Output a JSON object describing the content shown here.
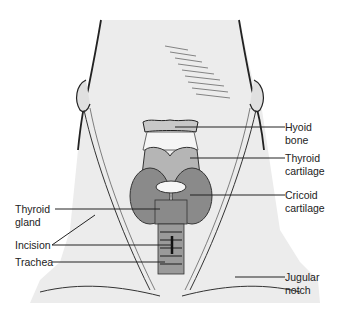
{
  "figure": {
    "labels": {
      "hyoid_bone": [
        "Hyoid",
        "bone"
      ],
      "thyroid_cartilage": [
        "Thyroid",
        "cartilage"
      ],
      "cricoid_cartilage": [
        "Cricoid",
        "cartilage"
      ],
      "thyroid_gland": [
        "Thyroid",
        "gland"
      ],
      "incision": [
        "Incision"
      ],
      "trachea": [
        "Trachea"
      ],
      "jugular_notch": [
        "Jugular",
        "notch"
      ]
    },
    "colors": {
      "skin": "#ececec",
      "thyroid_gland": "#8a8a8a",
      "cartilage": "#b5b5b5",
      "line": "#222222"
    }
  }
}
